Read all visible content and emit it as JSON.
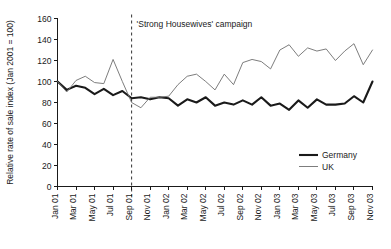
{
  "chart_data": {
    "type": "line",
    "title": "",
    "xlabel": "",
    "ylabel": "Relative rate of sale index (Jan 2001 = 100)",
    "ylim": [
      0,
      160
    ],
    "ytick_values": [
      0,
      20,
      40,
      60,
      80,
      100,
      120,
      140,
      160
    ],
    "ytick_labels": [
      "0",
      "20",
      "40",
      "60",
      "80",
      "100",
      "120",
      "140",
      "160"
    ],
    "grid": false,
    "legend_position": "bottom-right",
    "x": [
      "Jan 01",
      "Feb 01",
      "Mar 01",
      "Apr 01",
      "May 01",
      "Jun 01",
      "Jul 01",
      "Aug 01",
      "Sep 01",
      "Oct 01",
      "Nov 01",
      "Dec 01",
      "Jan 02",
      "Feb 02",
      "Mar 02",
      "Apr 02",
      "May 02",
      "Jun 02",
      "Jul 02",
      "Aug 02",
      "Sep 02",
      "Oct 02",
      "Nov 02",
      "Dec 02",
      "Jan 03",
      "Feb 03",
      "Mar 03",
      "Apr 03",
      "May 03",
      "Jun 03",
      "Jul 03",
      "Aug 03",
      "Sep 03",
      "Oct 03",
      "Nov 03"
    ],
    "xtick_labels": [
      "Jan 01",
      "Mar 01",
      "May 01",
      "Jul 01",
      "Sep 01",
      "Nov 01",
      "Jan 02",
      "Mar 02",
      "May 02",
      "Jul 02",
      "Sep 02",
      "Nov 02",
      "Jan 03",
      "Mar 03",
      "May 03",
      "Jul 03",
      "Sep 03",
      "Nov 03"
    ],
    "xtick_step_months": 2,
    "series": [
      {
        "name": "Germany",
        "color": "#1a1a1a",
        "line_width": "thick",
        "values": [
          100,
          92,
          96,
          94,
          88,
          93,
          87,
          91,
          84,
          85,
          83,
          85,
          84,
          77,
          83,
          80,
          85,
          77,
          80,
          78,
          82,
          78,
          85,
          77,
          79,
          73,
          82,
          75,
          83,
          78,
          78,
          79,
          86,
          80,
          100
        ]
      },
      {
        "name": "UK",
        "color": "#6e6e6e",
        "line_width": "thin",
        "values": [
          100,
          90,
          101,
          105,
          99,
          98,
          121,
          100,
          80,
          75,
          85,
          85,
          86,
          97,
          105,
          107,
          100,
          92,
          107,
          97,
          118,
          121,
          119,
          112,
          130,
          135,
          124,
          132,
          129,
          131,
          120,
          129,
          136,
          116,
          130
        ]
      }
    ],
    "annotations": [
      {
        "name": "campaign-marker",
        "label": "'Strong Housewives' campaign",
        "x": "Sep 01",
        "style": "dashed-vertical-line"
      }
    ]
  },
  "legend": {
    "items": [
      {
        "label": "Germany"
      },
      {
        "label": "UK"
      }
    ]
  },
  "caption": {
    "text": ""
  }
}
